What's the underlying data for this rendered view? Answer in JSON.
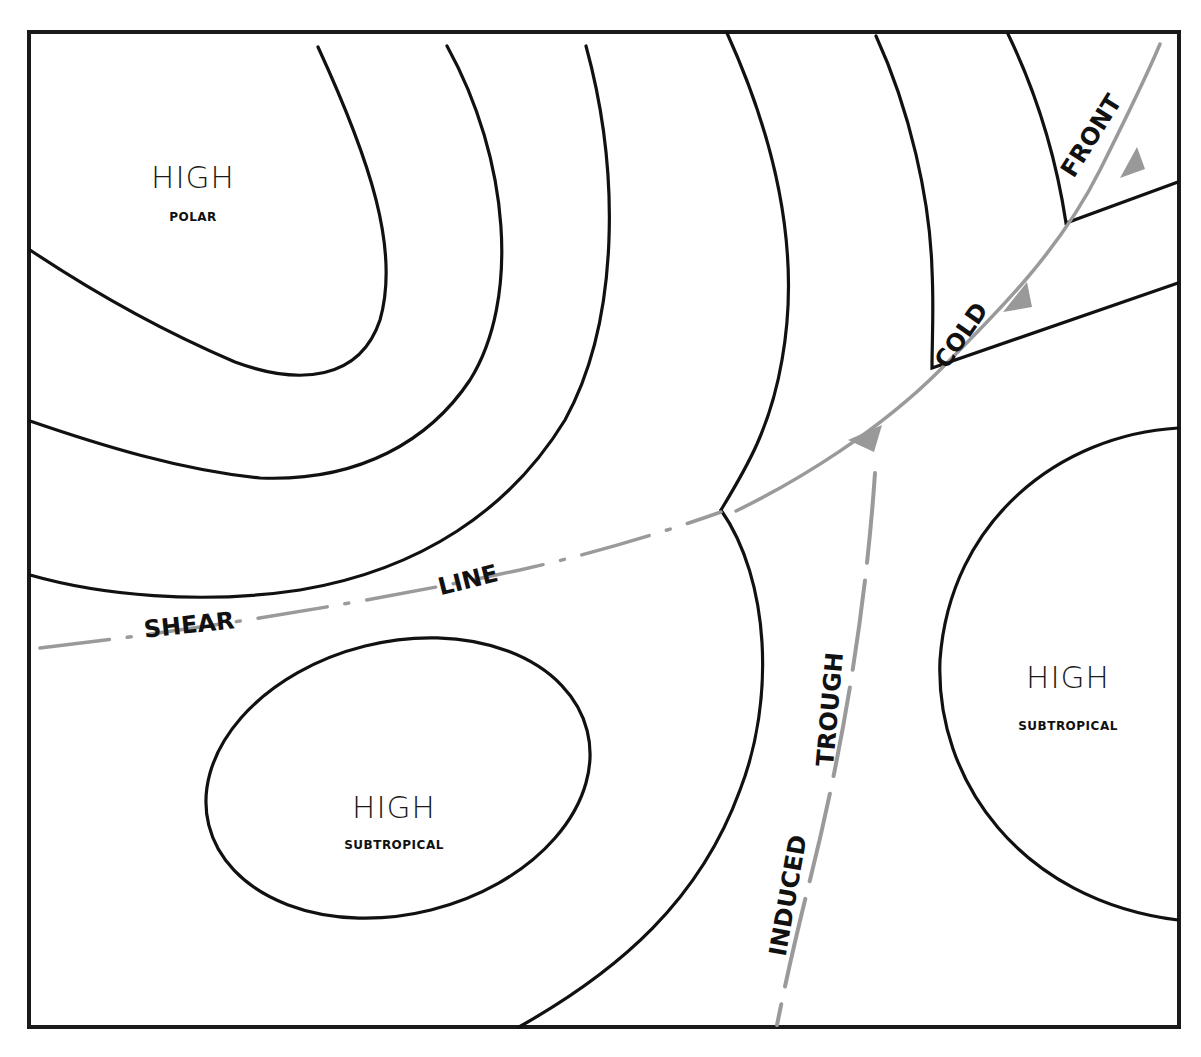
{
  "diagram": {
    "colors": {
      "isobar": "#111111",
      "front": "#9a9a9a",
      "background": "#ffffff"
    },
    "pressure_systems": [
      {
        "label": "HIGH",
        "type": "POLAR"
      },
      {
        "label": "HIGH",
        "type": "SUBTROPICAL"
      },
      {
        "label": "HIGH",
        "type": "SUBTROPICAL"
      }
    ],
    "features": {
      "cold_front": {
        "word1": "COLD",
        "word2": "FRONT"
      },
      "shear_line": {
        "word1": "SHEAR",
        "word2": "LINE"
      },
      "induced_trough": {
        "word1": "INDUCED",
        "word2": "TROUGH"
      }
    }
  }
}
